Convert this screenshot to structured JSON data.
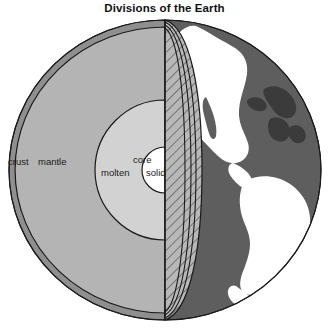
{
  "figure": {
    "title": "Divisions of the Earth",
    "width": 329,
    "height": 330
  },
  "labels": {
    "crust": "crust",
    "mantle": "mantle",
    "core": "core",
    "molten": "molten",
    "solid": "solid"
  },
  "colors": {
    "background": "#ffffff",
    "outline": "#1a1a1a",
    "crust": "#8f8f8f",
    "mantle": "#b4b4b4",
    "molten_core": "#d2d2d2",
    "solid_core": "#ffffff",
    "ocean": "#5e5e5e",
    "land": "#ffffff",
    "hatch_fill": "#b4b4b4",
    "hatch_line": "#3a3a3a",
    "text": "#1a1a1a"
  },
  "geometry": {
    "sphere_center_x": 165,
    "sphere_center_y": 170,
    "sphere_radius_x": 156,
    "sphere_radius_y": 150,
    "crust_outer_radius_x": 156,
    "mantle_outer_radius_x": 148,
    "molten_core_radius_x": 70,
    "solid_core_radius_x": 23,
    "cut_plane_x": 165
  },
  "label_positions": {
    "crust": {
      "x": 8,
      "y": 157
    },
    "mantle": {
      "x": 38,
      "y": 157
    },
    "core": {
      "x": 133,
      "y": 155
    },
    "molten": {
      "x": 101,
      "y": 168
    },
    "solid": {
      "x": 146,
      "y": 168
    }
  }
}
